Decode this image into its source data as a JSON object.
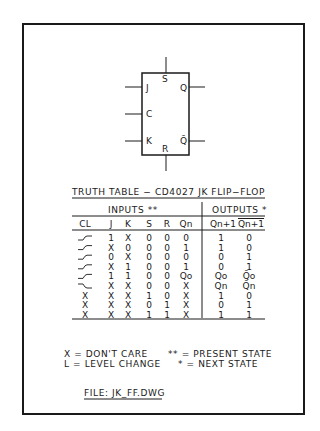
{
  "symbol": {
    "pins": {
      "s": "S",
      "j": "J",
      "q": "Q",
      "c": "C",
      "k": "K",
      "qbar": "Q̄",
      "r": "R"
    }
  },
  "title": "TRUTH TABLE − CD4027 JK FLIP−FLOP",
  "groups": {
    "inputs": "INPUTS **",
    "outputs": "OUTPUTS *"
  },
  "columns": [
    "CL",
    "J",
    "K",
    "S",
    "R",
    "Qn",
    "Qn+1",
    "Qn+1"
  ],
  "rows": [
    {
      "cl": "rise",
      "j": "1",
      "k": "X",
      "s": "0",
      "r": "0",
      "qn": "0",
      "qn1": "1",
      "qn1bar": "0"
    },
    {
      "cl": "rise",
      "j": "X",
      "k": "0",
      "s": "0",
      "r": "0",
      "qn": "1",
      "qn1": "1",
      "qn1bar": "0"
    },
    {
      "cl": "rise",
      "j": "0",
      "k": "X",
      "s": "0",
      "r": "0",
      "qn": "0",
      "qn1": "0",
      "qn1bar": "1"
    },
    {
      "cl": "rise",
      "j": "X",
      "k": "1",
      "s": "0",
      "r": "0",
      "qn": "1",
      "qn1": "0",
      "qn1bar": "1"
    },
    {
      "cl": "rise",
      "j": "1",
      "k": "1",
      "s": "0",
      "r": "0",
      "qn": "Qo",
      "qn1": "Qo",
      "qn1bar": "Q̄o"
    },
    {
      "cl": "fall",
      "j": "X",
      "k": "X",
      "s": "0",
      "r": "0",
      "qn": "X",
      "qn1": "Qn",
      "qn1bar": "Q̄n"
    },
    {
      "cl": "X",
      "j": "X",
      "k": "X",
      "s": "1",
      "r": "0",
      "qn": "X",
      "qn1": "1",
      "qn1bar": "0"
    },
    {
      "cl": "X",
      "j": "X",
      "k": "X",
      "s": "0",
      "r": "1",
      "qn": "X",
      "qn1": "0",
      "qn1bar": "1"
    },
    {
      "cl": "X",
      "j": "X",
      "k": "X",
      "s": "1",
      "r": "1",
      "qn": "X",
      "qn1": "1",
      "qn1bar": "1"
    }
  ],
  "legend": {
    "x": "X = DON'T CARE",
    "l": "L = LEVEL CHANGE",
    "pp": "** = PRESENT STATE",
    "p": "* = NEXT STATE"
  },
  "file": "FILE:  JK_FF.DWG"
}
